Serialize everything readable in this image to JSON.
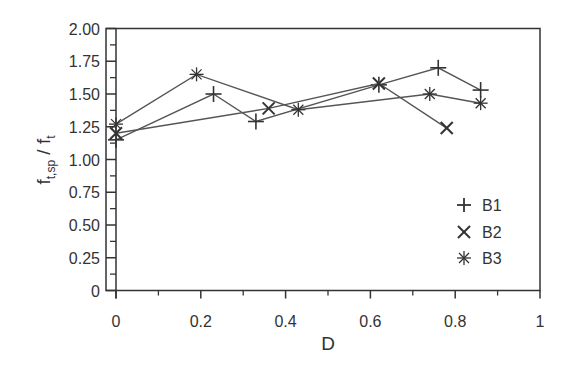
{
  "chart_data": {
    "type": "line",
    "title": "",
    "xlabel": "D",
    "ylabel": "f_t,sp / f_t",
    "ylabel_main": "f",
    "ylabel_sub1": "t,sp",
    "ylabel_sep": " / f",
    "ylabel_sub2": "t",
    "xlim": [
      0,
      1
    ],
    "ylim": [
      0,
      2.0
    ],
    "x_ticks": [
      0,
      0.2,
      0.4,
      0.6,
      0.8,
      1
    ],
    "x_tick_labels": [
      "0",
      "0.2",
      "0.4",
      "0.6",
      "0.8",
      "1"
    ],
    "y_ticks": [
      0,
      0.25,
      0.5,
      0.75,
      1.0,
      1.25,
      1.5,
      1.75,
      2.0
    ],
    "y_tick_labels": [
      "0",
      "0.25",
      "0.50",
      "0.75",
      "1.00",
      "1.25",
      "1.50",
      "1.75",
      "2.00"
    ],
    "grid": false,
    "legend_position": "lower right (inside)",
    "series": [
      {
        "name": "B1",
        "marker": "plus",
        "x": [
          0,
          0.23,
          0.33,
          0.62,
          0.76,
          0.86
        ],
        "y": [
          1.15,
          1.5,
          1.29,
          1.57,
          1.7,
          1.53
        ]
      },
      {
        "name": "B2",
        "marker": "x",
        "x": [
          0,
          0.36,
          0.62,
          0.78
        ],
        "y": [
          1.2,
          1.39,
          1.58,
          1.24
        ]
      },
      {
        "name": "B3",
        "marker": "asterisk",
        "x": [
          0,
          0.19,
          0.43,
          0.74,
          0.86
        ],
        "y": [
          1.27,
          1.65,
          1.38,
          1.5,
          1.43
        ]
      }
    ]
  },
  "legend": {
    "items": [
      {
        "label": "B1",
        "icon": "plus-marker-icon"
      },
      {
        "label": "B2",
        "icon": "x-marker-icon"
      },
      {
        "label": "B3",
        "icon": "asterisk-marker-icon"
      }
    ]
  },
  "colors": {
    "axis": "#333333",
    "line": "#555555",
    "marker": "#333333",
    "background": "#ffffff"
  }
}
